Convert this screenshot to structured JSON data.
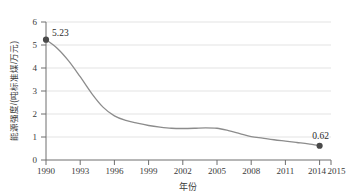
{
  "chart_data": {
    "type": "line",
    "title": "",
    "xlabel": "年份",
    "ylabel": "能源强度/(吨标准煤/万元)",
    "xlim": [
      1990,
      2015
    ],
    "ylim": [
      0,
      6
    ],
    "yticks": [
      "0",
      "1",
      "2",
      "3",
      "4",
      "5",
      "6"
    ],
    "xticks": [
      "1990",
      "1993",
      "1996",
      "1999",
      "2002",
      "2005",
      "2008",
      "2011",
      "2014",
      "2015"
    ],
    "grid": "horizontal",
    "legend": "none",
    "series": [
      {
        "name": "能源强度",
        "x": [
          1990,
          1991,
          1992,
          1993,
          1994,
          1995,
          1996,
          1997,
          1998,
          1999,
          2000,
          2001,
          2002,
          2003,
          2004,
          2005,
          2006,
          2007,
          2008,
          2009,
          2010,
          2011,
          2012,
          2013,
          2014
        ],
        "values": [
          5.23,
          4.85,
          4.3,
          3.62,
          2.9,
          2.3,
          1.92,
          1.72,
          1.6,
          1.5,
          1.43,
          1.38,
          1.37,
          1.38,
          1.4,
          1.38,
          1.28,
          1.15,
          1.02,
          0.95,
          0.88,
          0.82,
          0.76,
          0.7,
          0.62
        ]
      }
    ],
    "annotations": [
      {
        "name": "first-point",
        "x": 1990,
        "y": 5.23,
        "label": "5.23"
      },
      {
        "name": "last-point",
        "x": 2014,
        "y": 0.62,
        "label": "0.62"
      }
    ],
    "colors": {
      "line": "#8c8c8c",
      "marker": "#4a4a4a",
      "grid": "#d9d9d9",
      "axis": "#6e6e6e",
      "text": "#3a3a3a",
      "background": "#ffffff"
    }
  },
  "ytick_labels": {
    "t0": "0",
    "t1": "1",
    "t2": "2",
    "t3": "3",
    "t4": "4",
    "t5": "5",
    "t6": "6"
  },
  "xtick_labels": {
    "x0": "1990",
    "x1": "1993",
    "x2": "1996",
    "x3": "1999",
    "x4": "2002",
    "x5": "2005",
    "x6": "2008",
    "x7": "2011",
    "x8": "2014",
    "x9": "2015"
  },
  "labels": {
    "x_axis_title": "年份",
    "y_axis_title": "能源强度/(吨标准煤/万元)",
    "first_value": "5.23",
    "last_value": "0.62"
  }
}
